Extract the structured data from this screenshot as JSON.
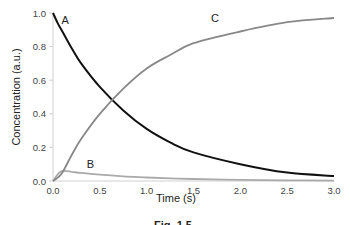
{
  "chart_data": {
    "type": "line",
    "title": "",
    "xlabel": "Time (s)",
    "ylabel": "Concentration (a.u.)",
    "xlim": [
      0,
      3.0
    ],
    "ylim": [
      0,
      1.0
    ],
    "x_ticks": [
      "0.0",
      "0.5",
      "1.0",
      "1.5",
      "2.0",
      "2.5",
      "3.0"
    ],
    "y_ticks": [
      "0.0",
      "0.2",
      "0.4",
      "0.6",
      "0.8",
      "1.0"
    ],
    "grid": false,
    "legend": "inline curve labels",
    "x": [
      0.0,
      0.05,
      0.1,
      0.2,
      0.3,
      0.5,
      0.75,
      1.0,
      1.25,
      1.5,
      2.0,
      2.5,
      3.0
    ],
    "series": [
      {
        "name": "A",
        "color": "#111111",
        "values": [
          1.0,
          0.94,
          0.89,
          0.79,
          0.7,
          0.56,
          0.42,
          0.31,
          0.23,
          0.17,
          0.1,
          0.05,
          0.03
        ]
      },
      {
        "name": "B",
        "color": "#aaaaaa",
        "values": [
          0.0,
          0.04,
          0.06,
          0.055,
          0.048,
          0.038,
          0.028,
          0.021,
          0.016,
          0.012,
          0.007,
          0.004,
          0.002
        ]
      },
      {
        "name": "C",
        "color": "#888888",
        "values": [
          0.0,
          0.02,
          0.05,
          0.155,
          0.25,
          0.4,
          0.55,
          0.67,
          0.75,
          0.82,
          0.89,
          0.945,
          0.97
        ]
      }
    ],
    "annotations": [
      {
        "text": "A",
        "x": 0.13,
        "y": 0.96
      },
      {
        "text": "B",
        "x": 0.4,
        "y": 0.1
      },
      {
        "text": "C",
        "x": 1.73,
        "y": 0.97
      }
    ]
  },
  "caption": "Fig. 1.5"
}
